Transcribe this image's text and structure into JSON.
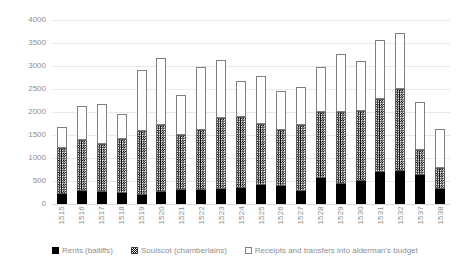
{
  "chart_data": {
    "type": "bar",
    "stacked": true,
    "title": "",
    "subtitle": "",
    "xlabel": "",
    "ylabel": "",
    "ylim": [
      0,
      4000
    ],
    "yticks": [
      0,
      500,
      1000,
      1500,
      2000,
      2500,
      3000,
      3500,
      4000
    ],
    "ytick_labels": [
      "0",
      "500",
      "1000",
      "1500",
      "2000",
      "2500",
      "3000",
      "3500",
      "4000"
    ],
    "grid": "horizontal",
    "legend_position": "bottom",
    "categories": [
      "1515",
      "1516",
      "1517",
      "1518",
      "1519",
      "1520",
      "1521",
      "1522",
      "1523",
      "1524",
      "1525",
      "1526",
      "1527",
      "1528",
      "1529",
      "1530",
      "1531",
      "1532",
      "1537",
      "1538"
    ],
    "series": [
      {
        "name": "Rents (bailiffs)",
        "pattern": "solid-black",
        "color": "#000000",
        "values": [
          220,
          275,
          265,
          230,
          205,
          260,
          300,
          310,
          325,
          350,
          415,
          390,
          285,
          560,
          440,
          490,
          700,
          720,
          630,
          325
        ]
      },
      {
        "name": "Soulscot (chamberlains)",
        "pattern": "checker-hatch",
        "color": "#000000",
        "values": [
          990,
          1110,
          1030,
          1190,
          1385,
          1465,
          1190,
          1300,
          1555,
          1540,
          1320,
          1215,
          1425,
          1440,
          1570,
          1540,
          1580,
          1770,
          545,
          465
        ]
      },
      {
        "name": "Receipts and transfers into alderman's budget",
        "pattern": "open-white",
        "color": "#ffffff",
        "values": [
          460,
          750,
          880,
          545,
          1315,
          1445,
          875,
          1360,
          1250,
          790,
          1040,
          845,
          840,
          970,
          1260,
          1085,
          1280,
          1220,
          1040,
          850
        ]
      }
    ],
    "totals": [
      1670,
      2135,
      2175,
      1965,
      2905,
      3170,
      2365,
      2970,
      3130,
      2680,
      2775,
      2450,
      2550,
      2970,
      3270,
      3115,
      3560,
      3710,
      2215,
      1640
    ]
  },
  "axis": {
    "tick_labels": [
      "4000",
      "3500",
      "3000",
      "2500",
      "2000",
      "1500",
      "1000",
      "500",
      "0"
    ]
  },
  "legend": {
    "items": [
      {
        "label": "Rents (bailiffs)",
        "swatch": "solid-black-swatch"
      },
      {
        "label": "Soulscot (chamberlains)",
        "swatch": "hatched-swatch"
      },
      {
        "label": "Receipts and transfers into alderman's budget",
        "swatch": "open-white-swatch"
      }
    ]
  },
  "colors": {
    "background": "#ffffff",
    "text": "#8f8f8f",
    "gridline": "#e8e8e8",
    "series_rents": "#000000",
    "series_receipts": "#ffffff",
    "series_outline": "#7f7f7f"
  }
}
